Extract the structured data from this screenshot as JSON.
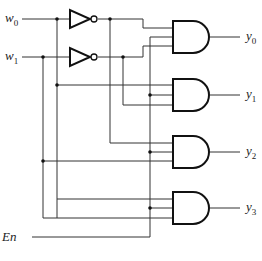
{
  "diagram": {
    "inputs": [
      {
        "name": "w",
        "sub": "0"
      },
      {
        "name": "w",
        "sub": "1"
      },
      {
        "name": "En",
        "sub": ""
      }
    ],
    "outputs": [
      {
        "name": "y",
        "sub": "0"
      },
      {
        "name": "y",
        "sub": "1"
      },
      {
        "name": "y",
        "sub": "2"
      },
      {
        "name": "y",
        "sub": "3"
      }
    ],
    "gates": {
      "inverters": 2,
      "and_gates": 4,
      "and_inputs": 3
    },
    "colors": {
      "wire": "#333333",
      "gate_stroke": "#111111",
      "background": "#ffffff"
    }
  }
}
